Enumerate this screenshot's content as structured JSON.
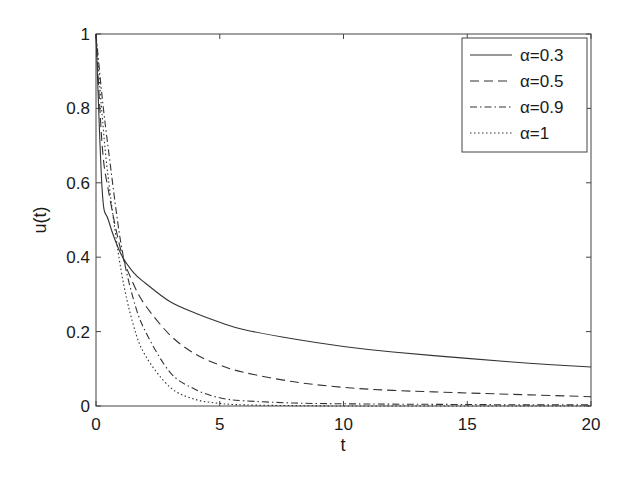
{
  "chart_data": {
    "type": "line",
    "title": "",
    "xlabel": "t",
    "ylabel": "u(t)",
    "xlim": [
      0,
      20
    ],
    "ylim": [
      0,
      1
    ],
    "xticks": [
      0,
      5,
      10,
      15,
      20
    ],
    "yticks": [
      0,
      0.2,
      0.4,
      0.6,
      0.8,
      1
    ],
    "xtick_labels": [
      "0",
      "5",
      "10",
      "15",
      "20"
    ],
    "ytick_labels": [
      "0",
      "0.2",
      "0.4",
      "0.6",
      "0.8",
      "1"
    ],
    "grid": false,
    "legend_position": "upper right",
    "x": [
      0,
      0.25,
      0.5,
      1,
      1.5,
      2,
      3,
      4,
      5,
      6,
      8,
      10,
      12,
      15,
      17.5,
      20
    ],
    "series": [
      {
        "name": "α=0.3",
        "style": "solid",
        "values": [
          1.0,
          0.58,
          0.5,
          0.41,
          0.36,
          0.33,
          0.28,
          0.25,
          0.225,
          0.205,
          0.18,
          0.16,
          0.145,
          0.128,
          0.115,
          0.105
        ]
      },
      {
        "name": "α=0.5",
        "style": "dashed",
        "values": [
          1.0,
          0.7,
          0.58,
          0.42,
          0.33,
          0.27,
          0.19,
          0.14,
          0.11,
          0.09,
          0.065,
          0.05,
          0.042,
          0.035,
          0.03,
          0.025
        ]
      },
      {
        "name": "α=0.9",
        "style": "dashdot",
        "values": [
          1.0,
          0.83,
          0.69,
          0.44,
          0.29,
          0.2,
          0.09,
          0.045,
          0.022,
          0.014,
          0.008,
          0.006,
          0.005,
          0.004,
          0.003,
          0.003
        ]
      },
      {
        "name": "α=1",
        "style": "dotted",
        "values": [
          1.0,
          0.78,
          0.61,
          0.37,
          0.22,
          0.135,
          0.05,
          0.018,
          0.007,
          0.003,
          0.001,
          0.0,
          0.0,
          0.0,
          0.0,
          0.0
        ]
      }
    ]
  }
}
